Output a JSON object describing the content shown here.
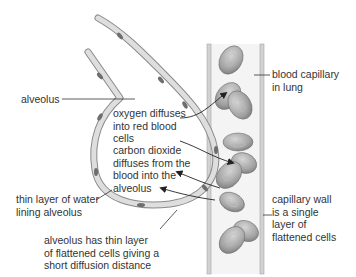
{
  "labels": {
    "alveolus": "alveolus",
    "blood_capillary": "blood capillary\nin lung",
    "oxygen": "oxygen diffuses\ninto red blood\ncells",
    "carbon_dioxide": "carbon dioxide\ndiffuses from the\nblood into the\nalveolus",
    "water_layer": "thin layer of water\nlining alveolus",
    "alveolus_wall": "alveolus has thin layer\nof flattened cells giving a\nshort diffusion distance",
    "capillary_wall": "capillary wall\nis a single\nlayer of\nflattened cells"
  },
  "colors": {
    "wall_cell": "#d9d9d9",
    "wall_outline": "#8a8a8a",
    "nucleus": "#6e6e6e",
    "capillary_fill": "#f4f4f4",
    "capillary_wall": "#c8c8c8",
    "red_cell": "#a8a8a8",
    "text": "#333333"
  }
}
